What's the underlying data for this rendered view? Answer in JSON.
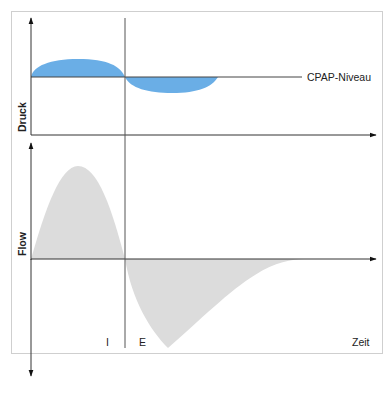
{
  "diagram": {
    "top_panel": {
      "y_axis_label": "Druck",
      "reference_line_label": "CPAP-Niveau",
      "fill_color": "#6aaee6"
    },
    "bottom_panel": {
      "y_axis_label": "Flow",
      "x_axis_label": "Zeit",
      "phase_labels": {
        "inspiration": "I",
        "expiration": "E"
      },
      "fill_color": "#dcdcdc"
    },
    "colors": {
      "axis": "#333333",
      "frame": "#cfcfcf"
    }
  }
}
